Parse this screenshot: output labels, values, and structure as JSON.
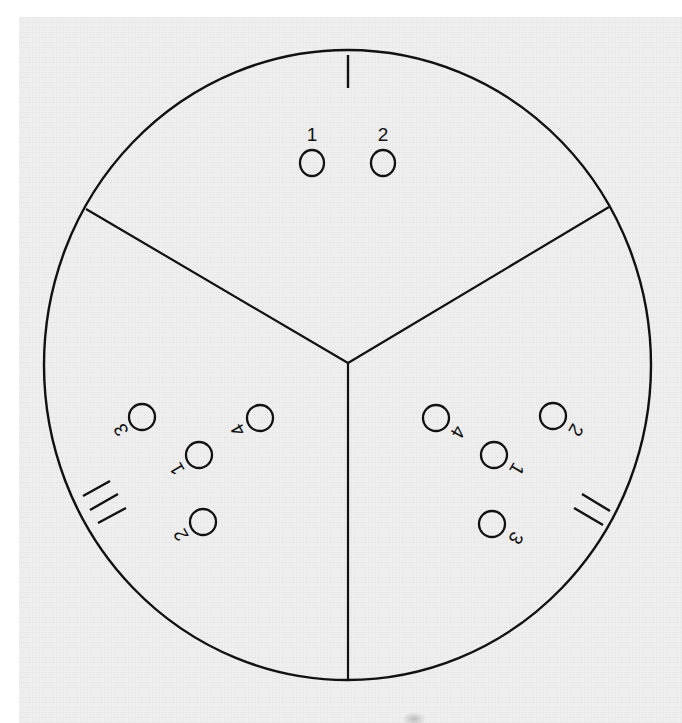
{
  "figure": {
    "background_color": "#ececec",
    "line_color": "#111111",
    "plate": {
      "shape": "circle",
      "center": [
        347,
        365
      ],
      "radius_x": 304,
      "radius_y": 315
    },
    "sectors": [
      {
        "id": "I",
        "marker": "I",
        "position": "top",
        "wells": [
          {
            "label": "1",
            "cx": 312,
            "cy": 163,
            "label_x": 312,
            "label_y": 134,
            "label_rotation": 0
          },
          {
            "label": "2",
            "cx": 383,
            "cy": 163,
            "label_x": 383,
            "label_y": 134,
            "label_rotation": 0
          }
        ]
      },
      {
        "id": "III",
        "marker": "III",
        "position": "lower-left",
        "wells": [
          {
            "label": "3",
            "cx": 142,
            "cy": 417,
            "label_x": 121,
            "label_y": 430,
            "label_rotation": 240
          },
          {
            "label": "4",
            "cx": 260,
            "cy": 418,
            "label_x": 238,
            "label_y": 430,
            "label_rotation": 240
          },
          {
            "label": "1",
            "cx": 199,
            "cy": 455,
            "label_x": 177,
            "label_y": 469,
            "label_rotation": 240
          },
          {
            "label": "2",
            "cx": 203,
            "cy": 522,
            "label_x": 181,
            "label_y": 535,
            "label_rotation": 240
          }
        ]
      },
      {
        "id": "II",
        "marker": "II",
        "position": "lower-right",
        "wells": [
          {
            "label": "4",
            "cx": 436,
            "cy": 418,
            "label_x": 458,
            "label_y": 432,
            "label_rotation": 120
          },
          {
            "label": "2",
            "cx": 553,
            "cy": 416,
            "label_x": 576,
            "label_y": 430,
            "label_rotation": 120
          },
          {
            "label": "1",
            "cx": 494,
            "cy": 455,
            "label_x": 517,
            "label_y": 469,
            "label_rotation": 120
          },
          {
            "label": "3",
            "cx": 492,
            "cy": 524,
            "label_x": 516,
            "label_y": 538,
            "label_rotation": 120
          }
        ]
      }
    ]
  }
}
